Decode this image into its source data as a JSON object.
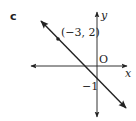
{
  "part_label": "c",
  "axes": {
    "x_label": "x",
    "y_label": "y",
    "origin_label": "O"
  },
  "line": {
    "point_label": "(−3, 2)",
    "y_intercept_label": "−1"
  },
  "colors": {
    "ink": "#222222",
    "axis": "#333333",
    "background": "#ffffff"
  }
}
